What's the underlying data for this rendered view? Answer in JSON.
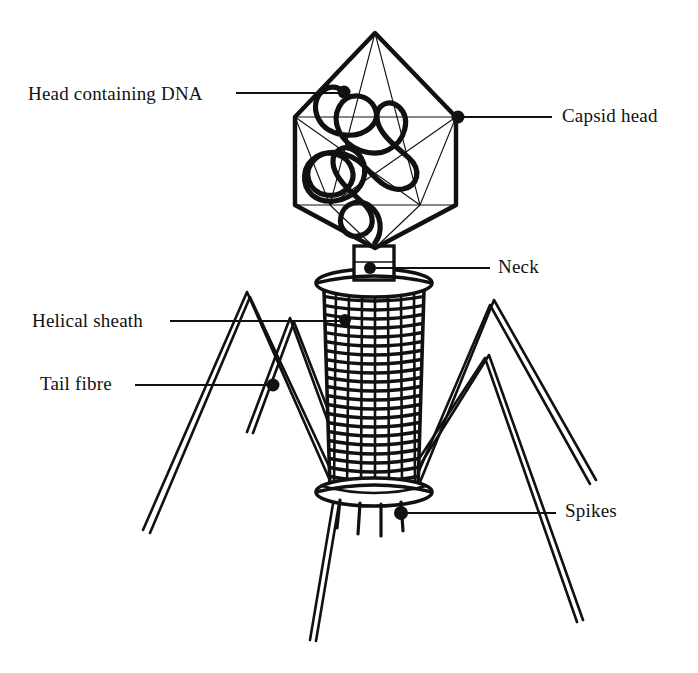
{
  "figure": {
    "style": "line drawing, black ink on white",
    "background_color": "#ffffff",
    "ink_color": "#111111"
  },
  "labels": [
    {
      "id": "head-containing-dna",
      "text": "Head containing DNA",
      "side": "left",
      "text_x": 28,
      "text_y": 83,
      "leader": {
        "x1": 236,
        "y1": 93,
        "x2": 343,
        "y2": 93
      },
      "dot": {
        "cx": 344,
        "cy": 92,
        "r": 6
      }
    },
    {
      "id": "capsid-head",
      "text": "Capsid head",
      "side": "right",
      "text_x": 562,
      "text_y": 105,
      "leader": {
        "x1": 462,
        "y1": 117,
        "x2": 552,
        "y2": 117
      },
      "dot": {
        "cx": 458,
        "cy": 117,
        "r": 6
      }
    },
    {
      "id": "neck",
      "text": "Neck",
      "side": "right",
      "text_x": 498,
      "text_y": 256,
      "leader": {
        "x1": 376,
        "y1": 268,
        "x2": 490,
        "y2": 268
      },
      "dot": {
        "cx": 370,
        "cy": 268,
        "r": 6
      }
    },
    {
      "id": "helical-sheath",
      "text": "Helical sheath",
      "side": "left",
      "text_x": 32,
      "text_y": 310,
      "leader": {
        "x1": 170,
        "y1": 321,
        "x2": 344,
        "y2": 321
      },
      "dot": {
        "cx": 345,
        "cy": 320,
        "r": 6
      }
    },
    {
      "id": "tail-fibre",
      "text": "Tail fibre",
      "side": "left",
      "text_x": 40,
      "text_y": 373,
      "leader": {
        "x1": 135,
        "y1": 385,
        "x2": 272,
        "y2": 385
      },
      "dot": {
        "cx": 273,
        "cy": 385,
        "r": 6
      }
    },
    {
      "id": "spikes",
      "text": "Spikes",
      "side": "right",
      "text_x": 565,
      "text_y": 500,
      "leader": {
        "x1": 404,
        "y1": 513,
        "x2": 556,
        "y2": 513
      },
      "dot": {
        "cx": 401,
        "cy": 513,
        "r": 6
      }
    }
  ],
  "structure": {
    "capsid": {
      "name": "icosahedral capsid head",
      "outline_points": "375,33 456,117 456,205 375,248 295,205 295,117",
      "facet_lines": [
        "375,33 295,117",
        "375,33 456,117",
        "375,33 330,205",
        "375,33 420,205",
        "295,117 456,117",
        "295,117 420,205",
        "295,117 330,205",
        "456,117 330,205",
        "456,117 420,205",
        "295,205 330,205",
        "456,205 420,205",
        "330,205 375,248",
        "420,205 375,248",
        "330,205 420,205"
      ],
      "outline_stroke_width": 4.2,
      "facet_stroke_width": 1.1
    },
    "dna": {
      "name": "coiled DNA strand inside head",
      "path": "M344,92 C332,80 312,96 320,116 C326,133 352,138 366,128 C381,117 372,98 358,96 C342,94 334,112 340,128 C346,146 368,156 384,150 C404,142 410,120 400,108 C392,98 378,104 378,116 C378,132 396,146 408,156 C420,166 418,182 404,186 C388,190 376,176 366,166 C352,152 330,148 318,158 C304,170 310,190 326,194 C342,198 356,184 352,170 C348,156 330,150 318,156 C304,163 302,182 312,192 C324,204 346,200 356,190 C368,178 366,160 356,152 C346,144 334,150 334,162 C334,176 350,190 362,200 C374,210 374,226 362,232 C350,238 340,228 342,216 C344,204 358,198 368,204 C380,211 382,228 374,238",
      "stroke_width": 5.0
    },
    "neck": {
      "name": "neck collar between head and sheath",
      "collar_rect": {
        "x": 354,
        "y": 247,
        "width": 40,
        "height": 32
      },
      "top_plate_ellipse": {
        "cx": 374,
        "cy": 283,
        "rx": 58,
        "ry": 14
      }
    },
    "sheath": {
      "name": "contractile helical sheath",
      "top_y": 288,
      "bottom_y": 489,
      "top_half_width": 50,
      "bottom_half_width": 44,
      "center_x": 374,
      "ring_count": 23,
      "ring_stroke_width": 3.4,
      "mesh_cells_per_ring": 7
    },
    "base_plate": {
      "name": "base plate",
      "ellipse": {
        "cx": 374,
        "cy": 492,
        "rx": 58,
        "ry": 14
      },
      "stroke_width": 3.4
    },
    "spikes": {
      "name": "base plate spikes",
      "items": [
        {
          "x1": 340,
          "y1": 500,
          "x2": 337,
          "y2": 528
        },
        {
          "x1": 360,
          "y1": 503,
          "x2": 358,
          "y2": 534
        },
        {
          "x1": 381,
          "y1": 504,
          "x2": 381,
          "y2": 536
        },
        {
          "x1": 401,
          "y1": 502,
          "x2": 403,
          "y2": 531
        }
      ],
      "stroke_width": 3.2
    },
    "tail_fibres": {
      "name": "tail fibres (kneed legs)",
      "count": 4,
      "stroke_width": 2.6,
      "items": [
        {
          "id": "fibre-left-outer",
          "knee": {
            "x": 247,
            "y": 292
          },
          "attach": {
            "x": 335,
            "y": 492
          },
          "foot": {
            "x": 143,
            "y": 530
          }
        },
        {
          "id": "fibre-left-inner",
          "knee": {
            "x": 290,
            "y": 318
          },
          "attach": {
            "x": 352,
            "y": 487
          },
          "foot": {
            "x": 247,
            "y": 432
          }
        },
        {
          "id": "fibre-right-outer",
          "knee": {
            "x": 494,
            "y": 300
          },
          "attach": {
            "x": 416,
            "y": 492
          },
          "foot": {
            "x": 596,
            "y": 480
          }
        },
        {
          "id": "fibre-right-inner",
          "knee": {
            "x": 489,
            "y": 355
          },
          "attach": {
            "x": 400,
            "y": 497
          },
          "foot": {
            "x": 583,
            "y": 620
          }
        }
      ],
      "long_legs": [
        {
          "x1": 335,
          "y1": 492,
          "x2": 310,
          "y2": 640
        },
        {
          "x1": 416,
          "y1": 492,
          "x2": 583,
          "y2": 620
        }
      ]
    }
  }
}
